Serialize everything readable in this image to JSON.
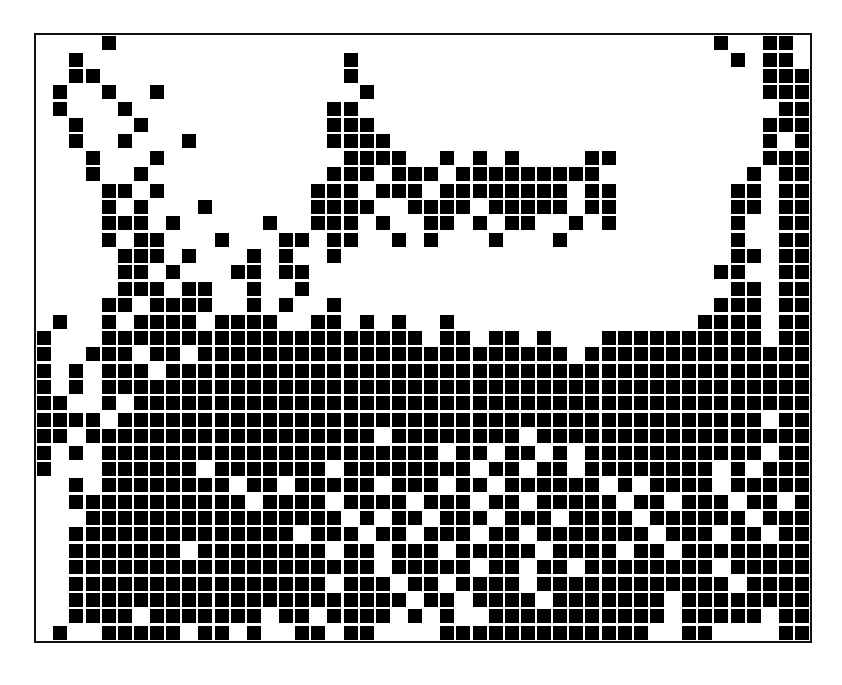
{
  "figure": {
    "type": "binary-occurrence-matrix",
    "title": "",
    "frame": {
      "border_color": "#111111",
      "border_width_px": 2,
      "background": "#ffffff"
    },
    "marker": {
      "shape": "square",
      "fill_color": "#000000",
      "fill_ratio": 0.86
    }
  },
  "left_label_fragments": [
    "s",
    "e",
    "s",
    "t"
  ],
  "chart_data": {
    "type": "heatmap",
    "title": "",
    "subtitle": "",
    "xlabel": "",
    "ylabel": "",
    "n_cols": 48,
    "n_rows": 37,
    "grid": false,
    "legend": "none",
    "value_labels": {
      "1": "present",
      "0": "absent"
    },
    "colors": {
      "1": "#000000",
      "0": "#ffffff"
    },
    "xlim": [
      0,
      48
    ],
    "ylim": [
      0,
      37
    ],
    "x": [
      0,
      1,
      2,
      3,
      4,
      5,
      6,
      7,
      8,
      9,
      10,
      11,
      12,
      13,
      14,
      15,
      16,
      17,
      18,
      19,
      20,
      21,
      22,
      23,
      24,
      25,
      26,
      27,
      28,
      29,
      30,
      31,
      32,
      33,
      34,
      35,
      36,
      37,
      38,
      39,
      40,
      41,
      42,
      43,
      44,
      45,
      46,
      47
    ],
    "categories": [
      "c0",
      "c1",
      "c2",
      "c3",
      "c4",
      "c5",
      "c6",
      "c7",
      "c8",
      "c9",
      "c10",
      "c11",
      "c12",
      "c13",
      "c14",
      "c15",
      "c16",
      "c17",
      "c18",
      "c19",
      "c20",
      "c21",
      "c22",
      "c23",
      "c24",
      "c25",
      "c26",
      "c27",
      "c28",
      "c29",
      "c30",
      "c31",
      "c32",
      "c33",
      "c34",
      "c35",
      "c36",
      "c37",
      "c38",
      "c39",
      "c40",
      "c41",
      "c42",
      "c43",
      "c44",
      "c45",
      "c46",
      "c47"
    ],
    "row_labels": [
      "r0",
      "r1",
      "r2",
      "r3",
      "r4",
      "r5",
      "r6",
      "r7",
      "r8",
      "r9",
      "r10",
      "r11",
      "r12",
      "r13",
      "r14",
      "r15",
      "r16",
      "r17",
      "r18",
      "r19",
      "r20",
      "r21",
      "r22",
      "r23",
      "r24",
      "r25",
      "r26",
      "r27",
      "r28",
      "r29",
      "r30",
      "r31",
      "r32",
      "r33",
      "r34",
      "r35",
      "r36"
    ],
    "matrix": [
      "000010000000000000000000000000000000000000100110",
      "001000000000000000010000000000000000000000010110",
      "001100000000000000010000000000000000000000000111",
      "010010010000000000001000000000000000000000000111",
      "010001000000000000110000000000000000000000000011",
      "001000100000000000111000000000000000000000000111",
      "001001000100000000111100000000000000000000000101",
      "000100010000000000011110010101000011000000000111",
      "000100100000000000111011101111111110000000001011",
      "000011010000000001110111011111111011000000011011",
      "000010100010000001111001111011111011000000011011",
      "000011101000001001110100110101100101000000010011",
      "000010110001000110110010100010001000000000010011",
      "000001110100010100100000000000000000000000011011",
      "000001101000110110000000000000000000000000110011",
      "000001110110010010000000000000000000000000011011",
      "000011011110010100100000000000000000000000111011",
      "010010111101111001101010010000000000000001111011",
      "100011111111111111111111011011010001111111111011",
      "100111011011111111111111111111111011111111111111",
      "101011101111111111111111111111111111111111111111",
      "101011111111111111111111111111111111111111111111",
      "110010111111111111111111111111111111111111111111",
      "111101111111111111111111111111111111111111111011",
      "110111111111111111111011111111011111111111111111",
      "101011111111111111111111101101101011111111111011",
      "100011111101111111011111111011011011111111010111",
      "001011111111011011111011101101111110101111011111",
      "001111111111101111011110111011011111011011101101",
      "000111111111111111101011011101110111101111110111",
      "001111111111111101110110111011011111110111011011",
      "001111111011111111011011101111101111011011111111",
      "001111111111111111111011111011011011111111011111",
      "001111111111111111011101101111011111111111101111",
      "001111111111111111111110110111101111111011111111",
      "001111011111110110111101010011111111111011111011",
      "010011111011010011011000011111111111110011000011"
    ]
  }
}
